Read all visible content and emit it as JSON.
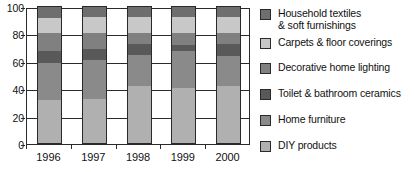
{
  "chart_data": {
    "type": "bar",
    "subtype": "stacked-bar-100",
    "title": "",
    "subtitle": "",
    "xlabel": "",
    "ylabel": "",
    "categories": [
      "1996",
      "1997",
      "1998",
      "1999",
      "2000"
    ],
    "ylim": [
      0,
      100
    ],
    "yticks": [
      0,
      20,
      40,
      60,
      80,
      100
    ],
    "ytick_labels": [
      "0",
      "20",
      "40",
      "60",
      "80",
      "100"
    ],
    "grid": true,
    "legend_position": "right",
    "stack_order": "bottom-to-top",
    "series": [
      {
        "name": "DIY products",
        "color": "#b0b0b0",
        "values": [
          32,
          33,
          42,
          41,
          42
        ]
      },
      {
        "name": "Home furniture",
        "color": "#8a8a8a",
        "values": [
          27,
          28,
          23,
          27,
          22
        ]
      },
      {
        "name": "Toilet & bathroom ceramics",
        "color": "#595959",
        "values": [
          9,
          8,
          8,
          4,
          9
        ]
      },
      {
        "name": "Decorative home lighting",
        "color": "#808080",
        "values": [
          13,
          12,
          8,
          9,
          8
        ]
      },
      {
        "name": "Carpets & floor coverings",
        "color": "#c8c8c8",
        "values": [
          11,
          12,
          12,
          12,
          12
        ]
      },
      {
        "name": "Household textiles & soft furnishings",
        "color": "#6e6e6e",
        "values": [
          8,
          7,
          7,
          7,
          7
        ]
      }
    ],
    "cumulative_tops": {
      "1996": [
        32,
        59,
        68,
        81,
        92,
        100
      ],
      "1997": [
        33,
        61,
        69,
        81,
        93,
        100
      ],
      "1998": [
        42,
        65,
        73,
        81,
        93,
        100
      ],
      "1999": [
        41,
        68,
        72,
        81,
        93,
        100
      ],
      "2000": [
        42,
        64,
        73,
        81,
        93,
        100
      ]
    }
  },
  "legend": {
    "items": [
      {
        "label": "Household textiles\n& soft furnishings",
        "color": "#6e6e6e"
      },
      {
        "label": "Carpets & floor coverings",
        "color": "#c8c8c8"
      },
      {
        "label": "Decorative home lighting",
        "color": "#808080"
      },
      {
        "label": "Toilet & bathroom ceramics",
        "color": "#595959"
      },
      {
        "label": "Home furniture",
        "color": "#8a8a8a"
      },
      {
        "label": "DIY products",
        "color": "#b0b0b0"
      }
    ]
  },
  "colors": {
    "axis": "#2a2a2a",
    "text": "#111111",
    "background": "#ffffff"
  }
}
